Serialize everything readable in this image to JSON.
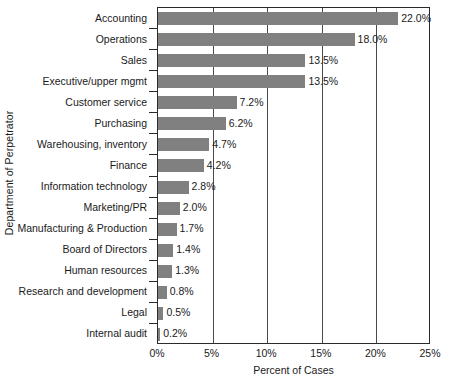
{
  "chart_data": {
    "type": "bar",
    "orientation": "horizontal",
    "title": "",
    "xlabel": "Percent of Cases",
    "ylabel": "Department of Perpetrator",
    "xlim": [
      0,
      25
    ],
    "xticks": [
      0,
      5,
      10,
      15,
      20,
      25
    ],
    "xtick_labels": [
      "0%",
      "5%",
      "10%",
      "15%",
      "20%",
      "25%"
    ],
    "grid": true,
    "grid_axis": "x",
    "legend": false,
    "bar_color": "#808080",
    "axis_color": "#2b2b2b",
    "categories": [
      "Accounting",
      "Operations",
      "Sales",
      "Executive/upper mgmt",
      "Customer service",
      "Purchasing",
      "Warehousing, inventory",
      "Finance",
      "Information technology",
      "Marketing/PR",
      "Manufacturing & Production",
      "Board of Directors",
      "Human resources",
      "Research and development",
      "Legal",
      "Internal audit"
    ],
    "values": [
      22.0,
      18.0,
      13.5,
      13.5,
      7.2,
      6.2,
      4.7,
      4.2,
      2.8,
      2.0,
      1.7,
      1.4,
      1.3,
      0.8,
      0.5,
      0.2
    ],
    "value_labels": [
      "22.0%",
      "18.0%",
      "13.5%",
      "13.5%",
      "7.2%",
      "6.2%",
      "4.7%",
      "4.2%",
      "2.8%",
      "2.0%",
      "1.7%",
      "1.4%",
      "1.3%",
      "0.8%",
      "0.5%",
      "0.2%"
    ]
  }
}
